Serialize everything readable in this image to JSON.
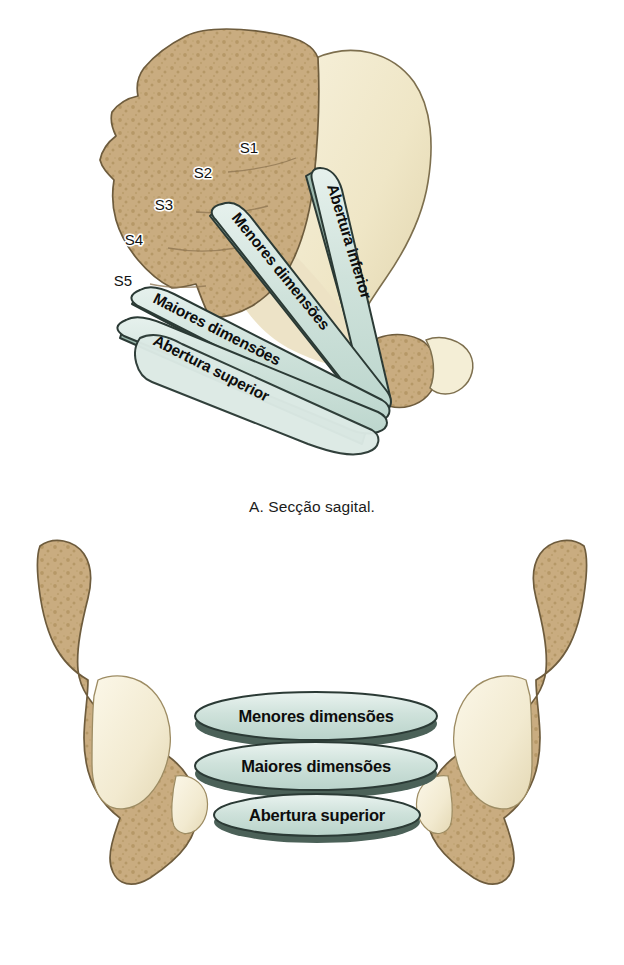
{
  "figure": {
    "panels": [
      {
        "id": "A",
        "caption": "A. Secção sagital.",
        "vertebrae": [
          {
            "label": "S1",
            "x": 259,
            "y": 148
          },
          {
            "label": "S2",
            "x": 207,
            "y": 173
          },
          {
            "label": "S3",
            "x": 167,
            "y": 205
          },
          {
            "label": "S4",
            "x": 135,
            "y": 240
          },
          {
            "label": "S5",
            "x": 123,
            "y": 281
          }
        ],
        "planes": [
          {
            "name": "Abertura inferior",
            "label": "Abertura inferior",
            "angle": 70
          },
          {
            "name": "Menores dimensoes",
            "label": "Menores dimensões",
            "angle": 38
          },
          {
            "name": "Maiores dimensoes",
            "label": "Maiores dimensões",
            "angle": 20
          },
          {
            "name": "Abertura superior",
            "label": "Abertura superior",
            "angle": 2
          }
        ]
      },
      {
        "id": "B",
        "caption": "B. Secção coronal.",
        "planes": [
          {
            "name": "Menores dimensoes",
            "label": "Menores dimensões",
            "cx": 316,
            "cy": 186,
            "rx": 121,
            "ry": 24
          },
          {
            "name": "Maiores dimensoes",
            "label": "Maiores dimensões",
            "cx": 316,
            "cy": 236,
            "rx": 121,
            "ry": 24
          },
          {
            "name": "Abertura superior",
            "label": "Abertura superior",
            "cx": 317,
            "cy": 285,
            "rx": 103,
            "ry": 21
          }
        ]
      }
    ]
  },
  "colors": {
    "background": "#ffffff",
    "cancellous_bone": "#c8ab7e",
    "cancellous_bone_light": "#d3bb94",
    "cancellous_speckle": "#ab8d5e",
    "cortical_bone": "#f2eacd",
    "cortical_bone_shadow": "#e3d7b2",
    "bone_outline": "#6e5c3d",
    "plane_fill": "#cfe1da",
    "plane_fill_light": "#e2eeea",
    "plane_edge": "#5d7a70",
    "plane_outline": "#2b3a35",
    "text": "#0d0d0d",
    "caption_text": "#1b1b1b"
  }
}
